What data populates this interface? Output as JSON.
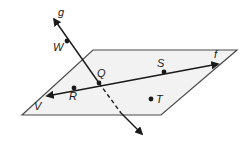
{
  "diagram": {
    "type": "geometry-plane-lines",
    "plane": {
      "label": "V",
      "fill": "#f2f2f2",
      "stroke": "#4a4a4a",
      "vertices": [
        [
          93,
          50
        ],
        [
          237,
          50
        ],
        [
          161,
          115
        ],
        [
          22,
          115
        ]
      ]
    },
    "lines": [
      {
        "name": "g",
        "label": "g",
        "from": [
          53,
          18
        ],
        "through": [
          99,
          83
        ],
        "to": [
          143,
          135
        ],
        "dashed_segment": [
          [
            99,
            83
          ],
          [
            121,
            113
          ]
        ]
      },
      {
        "name": "f",
        "label": "f",
        "from": [
          46,
          96
        ],
        "to": [
          219,
          64
        ]
      }
    ],
    "points": [
      {
        "label": "W",
        "pos": [
          67,
          41
        ],
        "label_pos": [
          53,
          48
        ]
      },
      {
        "label": "Q",
        "pos": [
          99,
          83
        ],
        "label_pos": [
          98,
          77
        ]
      },
      {
        "label": "R",
        "pos": [
          74,
          88
        ],
        "label_pos": [
          70,
          100
        ]
      },
      {
        "label": "S",
        "pos": [
          164,
          72
        ],
        "label_pos": [
          156,
          68
        ]
      },
      {
        "label": "T",
        "pos": [
          151,
          99
        ],
        "label_pos": [
          156,
          104
        ]
      }
    ],
    "labels": {
      "g": "g",
      "f": "f",
      "V": "V",
      "W": "W",
      "Q": "Q",
      "R": "R",
      "S": "S",
      "T": "T"
    },
    "colors": {
      "line": "#1a1a1a",
      "plane_edge": "#4a4a4a",
      "plane_fill": "#f2f2f2"
    }
  }
}
